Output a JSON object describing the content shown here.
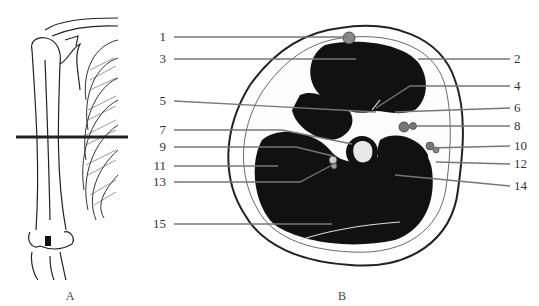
{
  "figure": {
    "panel_a": {
      "caption": "A",
      "subject": "upper-limb-skeleton-with-section-line"
    },
    "panel_b": {
      "caption": "B",
      "subject": "arm-cross-section"
    },
    "labels": [
      {
        "id": "1",
        "text": "1",
        "side": "left"
      },
      {
        "id": "2",
        "text": "2",
        "side": "right"
      },
      {
        "id": "3",
        "text": "3",
        "side": "left"
      },
      {
        "id": "4",
        "text": "4",
        "side": "right"
      },
      {
        "id": "5",
        "text": "5",
        "side": "left"
      },
      {
        "id": "6",
        "text": "6",
        "side": "right"
      },
      {
        "id": "7",
        "text": "7",
        "side": "left"
      },
      {
        "id": "8",
        "text": "8",
        "side": "right"
      },
      {
        "id": "9",
        "text": "9",
        "side": "left"
      },
      {
        "id": "10",
        "text": "10",
        "side": "right"
      },
      {
        "id": "11",
        "text": "11",
        "side": "left"
      },
      {
        "id": "12",
        "text": "12",
        "side": "right"
      },
      {
        "id": "13",
        "text": "13",
        "side": "left"
      },
      {
        "id": "14",
        "text": "14",
        "side": "right"
      },
      {
        "id": "15",
        "text": "15",
        "side": "left"
      }
    ]
  }
}
